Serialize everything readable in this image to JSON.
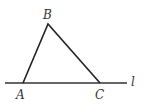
{
  "diagram": {
    "type": "geometry-triangle-on-line",
    "line": {
      "label": "l",
      "x1": 5,
      "y1": 83,
      "x2": 127,
      "y2": 83
    },
    "vertices": [
      {
        "label": "A",
        "x": 23,
        "y": 83
      },
      {
        "label": "B",
        "x": 48,
        "y": 24
      },
      {
        "label": "C",
        "x": 100,
        "y": 83
      }
    ],
    "stroke_color": "#333333"
  }
}
